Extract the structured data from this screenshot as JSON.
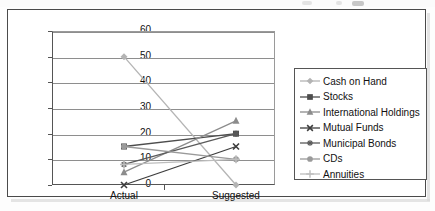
{
  "chart_data": {
    "type": "line",
    "title": "",
    "xlabel": "",
    "ylabel": "",
    "categories": [
      "Actual",
      "Suggested"
    ],
    "ylim": [
      0,
      60
    ],
    "yticks": [
      0,
      10,
      20,
      30,
      40,
      50,
      60
    ],
    "grid": true,
    "legend_position": "right",
    "series": [
      {
        "name": "Cash on Hand",
        "values": [
          50,
          0
        ],
        "marker": "diamond",
        "color": "#b4b4b4"
      },
      {
        "name": "Stocks",
        "values": [
          15,
          20
        ],
        "marker": "square",
        "color": "#4d4d4d"
      },
      {
        "name": "International Holdings",
        "values": [
          5,
          25
        ],
        "marker": "triangle",
        "color": "#8c8c8c"
      },
      {
        "name": "Mutual Funds",
        "values": [
          0,
          15
        ],
        "marker": "x",
        "color": "#3d3d3d"
      },
      {
        "name": "Municipal Bonds",
        "values": [
          8,
          20
        ],
        "marker": "asterisk",
        "color": "#5a5a5a"
      },
      {
        "name": "CDs",
        "values": [
          15,
          10
        ],
        "marker": "circle",
        "color": "#9a9a9a"
      },
      {
        "name": "Annuities",
        "values": [
          8,
          10
        ],
        "marker": "plus",
        "color": "#bdbdbd"
      }
    ]
  },
  "axis": {
    "ytick_labels": [
      "60",
      "50",
      "40",
      "30",
      "20",
      "10",
      "0"
    ],
    "xcat_labels": [
      "Actual",
      "Suggested"
    ]
  },
  "legend": {
    "items": [
      {
        "label": "Cash on Hand"
      },
      {
        "label": "Stocks"
      },
      {
        "label": "International Holdings"
      },
      {
        "label": "Mutual Funds"
      },
      {
        "label": "Municipal Bonds"
      },
      {
        "label": "CDs"
      },
      {
        "label": "Annuities"
      }
    ]
  },
  "colors": {
    "frame": "#4a4a4a",
    "gridline": "#8e8e8e",
    "axis": "#555555",
    "text": "#111111",
    "background": "#ffffff"
  }
}
